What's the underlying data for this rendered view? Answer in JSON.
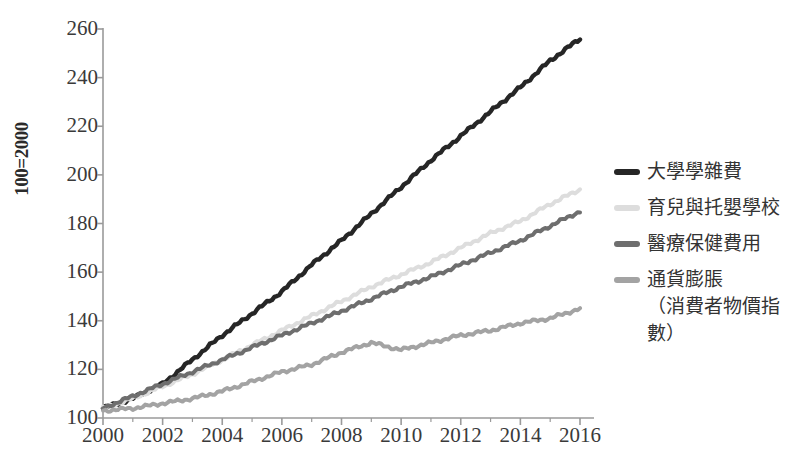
{
  "chart_data": {
    "type": "line",
    "title": "",
    "subtitle": "",
    "xlabel": "",
    "ylabel": "100=2000",
    "xlim": [
      2000,
      2016
    ],
    "ylim": [
      100,
      260
    ],
    "grid": false,
    "legend_position": "right",
    "x_tick_labels": [
      "2000",
      "2002",
      "2004",
      "2006",
      "2008",
      "2010",
      "2012",
      "2014",
      "2016"
    ],
    "x_tick_values": [
      2000,
      2002,
      2004,
      2006,
      2008,
      2010,
      2012,
      2014,
      2016
    ],
    "x_minor_ticks": [
      2001,
      2003,
      2005,
      2007,
      2009,
      2011,
      2013,
      2015
    ],
    "y_tick_labels": [
      "260",
      "240",
      "220",
      "200",
      "180",
      "160",
      "140",
      "120",
      "100"
    ],
    "y_tick_values": [
      260,
      240,
      220,
      200,
      180,
      160,
      140,
      120,
      100
    ],
    "x": [
      2000,
      2001,
      2002,
      2003,
      2004,
      2005,
      2006,
      2007,
      2008,
      2009,
      2010,
      2011,
      2012,
      2013,
      2014,
      2015,
      2016
    ],
    "series": [
      {
        "name": "大學學雜費",
        "color": "#262626",
        "values": [
          104,
          108,
          114,
          124,
          134,
          143,
          152,
          163,
          173,
          184,
          195,
          206,
          216,
          226,
          236,
          247,
          256
        ]
      },
      {
        "name": "育兒與托嬰學校",
        "color": "#dddddd",
        "values": [
          104,
          108,
          113,
          118,
          124,
          130,
          136,
          142,
          148,
          154,
          159,
          164,
          170,
          176,
          181,
          188,
          194
        ]
      },
      {
        "name": "醫療保健費用",
        "color": "#6e6e6e",
        "values": [
          104,
          109,
          114,
          119,
          124,
          129,
          134,
          139,
          144,
          149,
          154,
          158,
          163,
          168,
          173,
          179,
          185
        ]
      },
      {
        "name": "通貨膨脹\n（消費者物價指數）",
        "color": "#a3a3a3",
        "values": [
          103,
          104,
          106,
          108,
          111,
          115,
          119,
          122,
          127,
          131,
          128,
          131,
          134,
          136,
          139,
          141,
          145
        ]
      }
    ]
  },
  "axis": {
    "y_title": "100=2000"
  },
  "legend": {
    "items": [
      {
        "label": "大學學雜費",
        "color": "#262626"
      },
      {
        "label": "育兒與托嬰學校",
        "color": "#dddddd"
      },
      {
        "label": "醫療保健費用",
        "color": "#6e6e6e"
      },
      {
        "label": "通貨膨脹\n（消費者物價指數）",
        "color": "#a3a3a3"
      }
    ]
  }
}
